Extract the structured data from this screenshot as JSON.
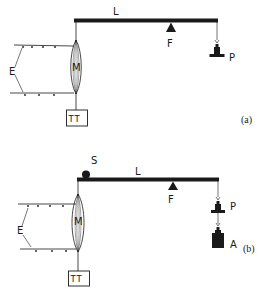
{
  "figure": {
    "panels": [
      {
        "id": "a",
        "panel_label": "(a)",
        "lever_label": "L",
        "fulcrum_label": "F",
        "muscle_label": "M",
        "electrodes_label": "E",
        "transducer_label": "TT",
        "weight_pan_label": "P",
        "has_stop": false,
        "has_afterload": false
      },
      {
        "id": "b",
        "panel_label": "(b)",
        "lever_label": "L",
        "fulcrum_label": "F",
        "muscle_label": "M",
        "electrodes_label": "E",
        "transducer_label": "TT",
        "weight_pan_label": "P",
        "stop_label": "S",
        "afterload_label": "A",
        "has_stop": true,
        "has_afterload": true
      }
    ],
    "colors": {
      "ink": "#1a1a1a",
      "background": "#ffffff"
    }
  }
}
